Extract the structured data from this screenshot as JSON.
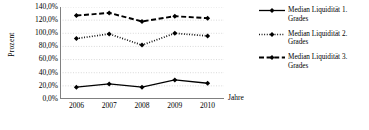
{
  "chart_data": {
    "type": "line",
    "title": "",
    "xlabel": "Jahre",
    "ylabel": "Prozent",
    "categories": [
      "2006",
      "2007",
      "2008",
      "2009",
      "2010"
    ],
    "x": [
      2006,
      2007,
      2008,
      2009,
      2010
    ],
    "ylim": [
      0,
      140
    ],
    "ytick_labels": [
      "140,0%",
      "120,0%",
      "100,0%",
      "80,0%",
      "60,0%",
      "40,0%",
      "20,0%",
      "0,0%"
    ],
    "ytick_values": [
      140,
      120,
      100,
      80,
      60,
      40,
      20,
      0
    ],
    "grid": true,
    "grid_axis": "y",
    "legend_position": "right",
    "series": [
      {
        "name": "Median Liquidität 1. Grades",
        "values": [
          18,
          23,
          18,
          29,
          24
        ],
        "style": "solid",
        "marker": "diamond",
        "color": "#000000"
      },
      {
        "name": "Median Liquidität 2. Grades",
        "values": [
          92,
          99,
          82,
          100,
          96
        ],
        "style": "dotted",
        "marker": "diamond",
        "color": "#000000"
      },
      {
        "name": "Median Liquidität 3. Grades",
        "values": [
          127,
          131,
          118,
          126,
          123
        ],
        "style": "dashed",
        "marker": "diamond",
        "color": "#000000"
      }
    ]
  },
  "axes": {
    "y_title": "Prozent",
    "x_title": "Jahre"
  },
  "legend": {
    "entries": [
      {
        "line1": "Median Liquidität 1.",
        "line2": "Grades"
      },
      {
        "line1": "Median Liquidität 2.",
        "line2": "Grades"
      },
      {
        "line1": "Median Liquidität 3.",
        "line2": "Grades"
      }
    ]
  },
  "colors": {
    "ink": "#000000",
    "grid": "#c8c8c8",
    "axis": "#808080",
    "background": "#ffffff"
  }
}
